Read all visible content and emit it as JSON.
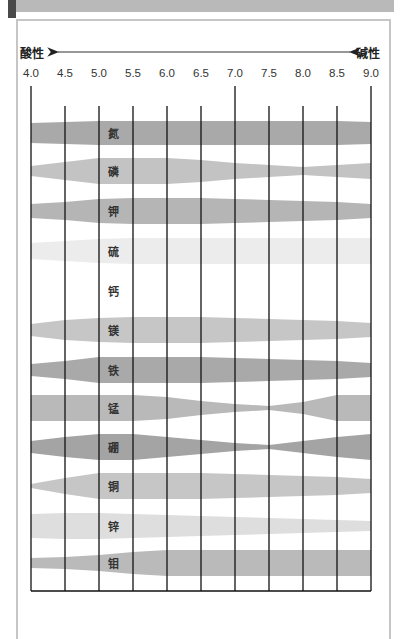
{
  "header": {
    "bar_color": "#b9b9b9",
    "accent_color": "#4a4a4a"
  },
  "chart_data": {
    "type": "area",
    "title": "",
    "left_label": "酸性",
    "right_label": "碱性",
    "x": [
      4.0,
      4.5,
      5.0,
      5.5,
      6.0,
      6.5,
      7.0,
      7.5,
      8.0,
      8.5,
      9.0
    ],
    "x_tick_labels": [
      "4.0",
      "4.5",
      "5.0",
      "5.5",
      "6.0",
      "6.5",
      "7.0",
      "7.5",
      "8.0",
      "8.5",
      "9.0"
    ],
    "xlim": [
      4.0,
      9.0
    ],
    "grid": true,
    "series": [
      {
        "name": "氮",
        "color": "#a9a9a9",
        "values": [
          20,
          22,
          24,
          24,
          24,
          24,
          24,
          24,
          24,
          24,
          22
        ]
      },
      {
        "name": "磷",
        "color": "#c3c3c3",
        "values": [
          10,
          18,
          26,
          26,
          26,
          22,
          16,
          12,
          8,
          12,
          16
        ]
      },
      {
        "name": "钾",
        "color": "#b5b5b5",
        "values": [
          14,
          18,
          24,
          26,
          26,
          26,
          24,
          22,
          20,
          18,
          14
        ]
      },
      {
        "name": "硫",
        "color": "#ececec",
        "values": [
          16,
          20,
          24,
          26,
          26,
          26,
          26,
          26,
          26,
          26,
          26
        ]
      },
      {
        "name": "钙",
        "color": "#ffffff",
        "values": [
          10,
          14,
          18,
          22,
          26,
          26,
          26,
          26,
          26,
          26,
          26
        ]
      },
      {
        "name": "镁",
        "color": "#c6c6c6",
        "values": [
          12,
          20,
          24,
          26,
          26,
          26,
          24,
          22,
          20,
          18,
          14
        ]
      },
      {
        "name": "铁",
        "color": "#a9a9a9",
        "values": [
          12,
          18,
          26,
          26,
          26,
          26,
          24,
          22,
          20,
          18,
          14
        ]
      },
      {
        "name": "锰",
        "color": "#b9b9b9",
        "values": [
          26,
          26,
          26,
          26,
          22,
          14,
          8,
          4,
          12,
          26,
          26
        ]
      },
      {
        "name": "硼",
        "color": "#a4a4a4",
        "values": [
          12,
          20,
          26,
          26,
          20,
          14,
          8,
          4,
          12,
          20,
          26
        ]
      },
      {
        "name": "铜",
        "color": "#c6c6c6",
        "values": [
          4,
          16,
          26,
          26,
          26,
          26,
          24,
          22,
          20,
          18,
          14
        ]
      },
      {
        "name": "锌",
        "color": "#dedede",
        "values": [
          24,
          26,
          26,
          24,
          22,
          20,
          18,
          16,
          14,
          12,
          10
        ]
      },
      {
        "name": "钼",
        "color": "#bababa",
        "values": [
          10,
          12,
          16,
          22,
          26,
          26,
          26,
          26,
          26,
          26,
          26
        ]
      }
    ]
  }
}
